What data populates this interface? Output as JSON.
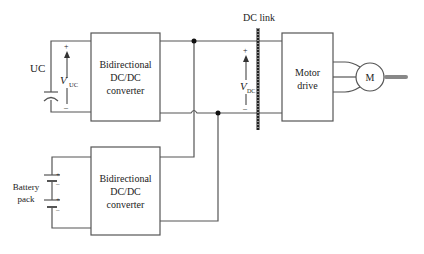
{
  "diagram": {
    "uc_label": "UC",
    "vuc_label": "V",
    "vuc_sub": "UC",
    "vdc_label": "V",
    "vdc_sub": "DC",
    "dc_link_label": "DC link",
    "converter_top": [
      "Bidirectional",
      "DC/DC",
      "converter"
    ],
    "converter_bottom": [
      "Bidirectional",
      "DC/DC",
      "converter"
    ],
    "motor_drive": [
      "Motor",
      "drive"
    ],
    "motor_label": "M",
    "battery_label": [
      "Battery",
      "pack"
    ],
    "plus": "+",
    "minus": "–",
    "colors": {
      "line": "#555555",
      "text": "#222222",
      "shaft": "#888888"
    }
  }
}
